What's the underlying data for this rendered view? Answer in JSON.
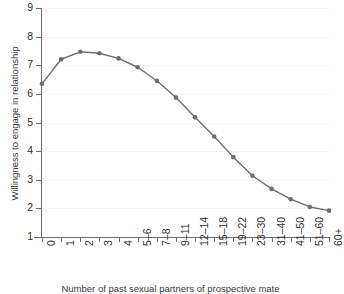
{
  "chart_data": {
    "type": "line",
    "title": "",
    "xlabel": "Number of past sexual partners of prospective mate",
    "ylabel": "Willingness to engage in relationship",
    "categories": [
      "0",
      "1",
      "2",
      "3",
      "4",
      "5–6",
      "7–8",
      "9–11",
      "12–14",
      "15–18",
      "19–22",
      "23–30",
      "31–40",
      "41–50",
      "51–60",
      "60+"
    ],
    "values": [
      6.35,
      7.21,
      7.47,
      7.42,
      7.24,
      6.93,
      6.46,
      5.87,
      5.18,
      4.51,
      3.79,
      3.14,
      2.68,
      2.32,
      2.05,
      1.92
    ],
    "ylim": [
      1,
      9
    ],
    "yticks": [
      1,
      2,
      3,
      4,
      5,
      6,
      7,
      8,
      9
    ],
    "ytick_labels": [
      "1",
      "2",
      "3",
      "4",
      "5",
      "6",
      "7",
      "8",
      "9"
    ],
    "grid": true,
    "legend": false,
    "series_color": "#6e6e6e",
    "marker": "circle",
    "marker_size": 4,
    "grid_color": "#f4f4f6",
    "axis_color": "#6d6d6d"
  }
}
